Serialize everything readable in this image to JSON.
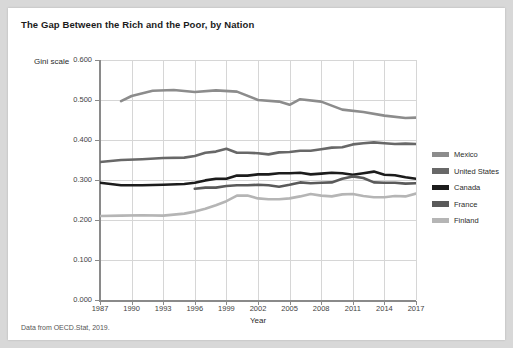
{
  "card": {
    "title": "The Gap Between the Rich and the Poor, by Nation",
    "footer": "Data from OECD.Stat, 2019.",
    "y_axis_caption": "Gini scale"
  },
  "chart_data": {
    "type": "line",
    "title": "The Gap Between the Rich and the Poor, by Nation",
    "subtitle": "",
    "source_note": "Data from OECD.Stat, 2019.",
    "xlabel": "Year",
    "ylabel": "Gini scale",
    "xlim": [
      1987,
      2017
    ],
    "ylim": [
      0.0,
      0.6
    ],
    "ytick_labels": [
      "0.000",
      "0.100",
      "0.200",
      "0.300",
      "0.400",
      "0.500",
      "0.600"
    ],
    "ytick_values": [
      0.0,
      0.1,
      0.2,
      0.3,
      0.4,
      0.5,
      0.6
    ],
    "xtick_labels": [
      "1987",
      "1990",
      "1993",
      "1996",
      "1999",
      "2002",
      "2005",
      "2008",
      "2011",
      "2014",
      "2017"
    ],
    "xtick_values": [
      1987,
      1990,
      1993,
      1996,
      1999,
      2002,
      2005,
      2008,
      2011,
      2014,
      2017
    ],
    "grid": true,
    "legend_position": "right",
    "series": [
      {
        "name": "Mexico",
        "color": "#8c8c8c",
        "x": [
          1989,
          1990,
          1992,
          1994,
          1996,
          1998,
          2000,
          2002,
          2004,
          2005,
          2006,
          2008,
          2010,
          2012,
          2014,
          2016,
          2017
        ],
        "values": [
          0.497,
          0.51,
          0.523,
          0.525,
          0.52,
          0.524,
          0.521,
          0.5,
          0.496,
          0.488,
          0.502,
          0.496,
          0.476,
          0.47,
          0.461,
          0.455,
          0.456
        ]
      },
      {
        "name": "United States",
        "color": "#686868",
        "x": [
          1987,
          1989,
          1991,
          1993,
          1995,
          1996,
          1997,
          1998,
          1999,
          2000,
          2001,
          2002,
          2003,
          2004,
          2005,
          2006,
          2007,
          2008,
          2009,
          2010,
          2011,
          2012,
          2013,
          2014,
          2015,
          2016,
          2017
        ],
        "values": [
          0.345,
          0.35,
          0.352,
          0.355,
          0.356,
          0.36,
          0.368,
          0.371,
          0.378,
          0.368,
          0.368,
          0.367,
          0.364,
          0.369,
          0.37,
          0.373,
          0.373,
          0.377,
          0.381,
          0.382,
          0.389,
          0.392,
          0.394,
          0.392,
          0.39,
          0.391,
          0.39
        ]
      },
      {
        "name": "Canada",
        "color": "#1c1c1c",
        "x": [
          1987,
          1989,
          1991,
          1993,
          1995,
          1996,
          1997,
          1998,
          1999,
          2000,
          2001,
          2002,
          2003,
          2004,
          2005,
          2006,
          2007,
          2008,
          2009,
          2010,
          2011,
          2012,
          2013,
          2014,
          2015,
          2016,
          2017
        ],
        "values": [
          0.293,
          0.287,
          0.287,
          0.288,
          0.29,
          0.293,
          0.299,
          0.303,
          0.303,
          0.311,
          0.311,
          0.314,
          0.314,
          0.317,
          0.317,
          0.318,
          0.314,
          0.316,
          0.318,
          0.317,
          0.313,
          0.317,
          0.321,
          0.313,
          0.312,
          0.307,
          0.303
        ]
      },
      {
        "name": "France",
        "color": "#5a5a5a",
        "x": [
          1996,
          1997,
          1998,
          1999,
          2000,
          2001,
          2002,
          2003,
          2004,
          2005,
          2006,
          2007,
          2008,
          2009,
          2010,
          2011,
          2012,
          2013,
          2014,
          2015,
          2016,
          2017
        ],
        "values": [
          0.278,
          0.281,
          0.281,
          0.285,
          0.287,
          0.287,
          0.288,
          0.287,
          0.283,
          0.288,
          0.294,
          0.292,
          0.293,
          0.294,
          0.303,
          0.309,
          0.305,
          0.294,
          0.293,
          0.293,
          0.291,
          0.292
        ]
      },
      {
        "name": "Finland",
        "color": "#b5b5b5",
        "x": [
          1987,
          1989,
          1991,
          1993,
          1995,
          1996,
          1997,
          1998,
          1999,
          2000,
          2001,
          2002,
          2003,
          2004,
          2005,
          2006,
          2007,
          2008,
          2009,
          2010,
          2011,
          2012,
          2013,
          2014,
          2015,
          2016,
          2017
        ],
        "values": [
          0.21,
          0.211,
          0.212,
          0.211,
          0.216,
          0.221,
          0.228,
          0.237,
          0.247,
          0.261,
          0.261,
          0.254,
          0.252,
          0.252,
          0.254,
          0.259,
          0.265,
          0.261,
          0.259,
          0.264,
          0.265,
          0.26,
          0.257,
          0.257,
          0.26,
          0.259,
          0.266
        ]
      }
    ]
  },
  "legend": {
    "items": [
      {
        "label": "Mexico",
        "color": "#8c8c8c"
      },
      {
        "label": "United States",
        "color": "#686868"
      },
      {
        "label": "Canada",
        "color": "#1c1c1c"
      },
      {
        "label": "France",
        "color": "#5a5a5a"
      },
      {
        "label": "Finland",
        "color": "#b5b5b5"
      }
    ]
  }
}
